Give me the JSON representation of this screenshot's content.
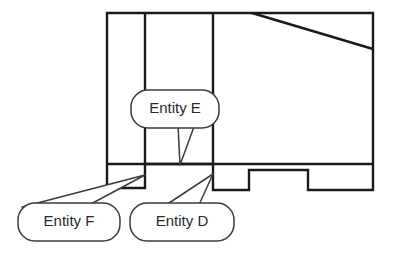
{
  "diagram": {
    "type": "engineering-line-drawing",
    "background_color": "#ffffff",
    "line_color": "#1a1a1a",
    "callout_line_color": "#3b3b3b",
    "text_color": "#2a2a2a",
    "canvas": {
      "width": 402,
      "height": 263
    },
    "part": {
      "name": "machined-block-profile",
      "body_outline": "M 107,13 L 373,13 L 373,190 L 308,190 L 308,170 L 249,170 L 249,190 L 213,190 L 213,164 L 145,164 L 145,188 L 107,188 Z",
      "internal_edges": [
        {
          "name": "vertical-rib-left",
          "x1": 145,
          "y1": 13,
          "x2": 145,
          "y2": 164
        },
        {
          "name": "vertical-rib-right",
          "x1": 213,
          "y1": 13,
          "x2": 213,
          "y2": 164
        },
        {
          "name": "base-separator",
          "x1": 107,
          "y1": 164,
          "x2": 373,
          "y2": 164
        },
        {
          "name": "chamfer-diagonal",
          "x1": 252,
          "y1": 13,
          "x2": 373,
          "y2": 49
        }
      ]
    },
    "callouts": [
      {
        "id": "entity-e",
        "label": "Entity E",
        "box": {
          "x": 131,
          "y": 90,
          "width": 88,
          "height": 38,
          "rx": 17
        },
        "text_point": {
          "x": 175,
          "y": 109
        },
        "tail": "M 178,125 L 180,165 L 195,124 Z",
        "pointer_target": {
          "x": 180,
          "y": 165
        }
      },
      {
        "id": "entity-f",
        "label": "Entity F",
        "box": {
          "x": 18,
          "y": 203,
          "width": 102,
          "height": 38,
          "rx": 17
        },
        "text_point": {
          "x": 69,
          "y": 222
        },
        "tail": "M 22,207 L 145,175 L 89,205 Z",
        "pointer_target": {
          "x": 145,
          "y": 175
        }
      },
      {
        "id": "entity-d",
        "label": "Entity D",
        "box": {
          "x": 130,
          "y": 203,
          "width": 104,
          "height": 38,
          "rx": 17
        },
        "text_point": {
          "x": 182,
          "y": 222
        },
        "tail": "M 166,205 L 213,174 L 198,207 Z",
        "pointer_target": {
          "x": 213,
          "y": 174
        }
      }
    ]
  }
}
